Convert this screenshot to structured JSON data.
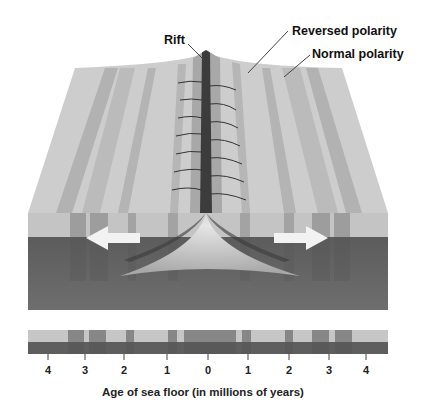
{
  "labels": {
    "rift": "Rift",
    "reversed": "Reversed polarity",
    "normal": "Normal polarity"
  },
  "axis": {
    "ticks": [
      "4",
      "3",
      "2",
      "1",
      "0",
      "1",
      "2",
      "3",
      "4"
    ],
    "caption": "Age of sea floor (in millions of years)"
  },
  "colors": {
    "normal_band": "#c8c8c8",
    "reversed_band": "#a9a9a9",
    "crust_dark": "#5a5a5a",
    "mantle": "#6a6a6a",
    "magma": "#cfcfcf",
    "arrow": "#f2f2f2"
  }
}
